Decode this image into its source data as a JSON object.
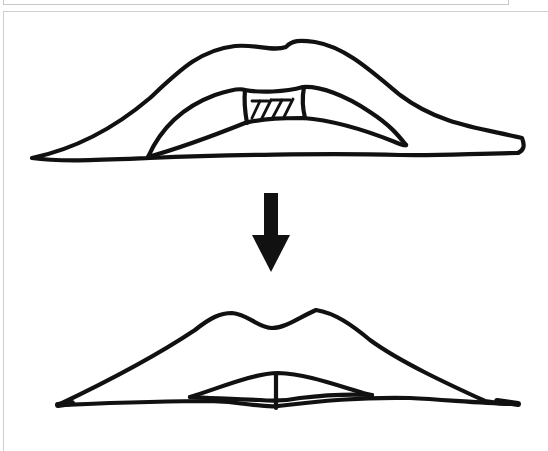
{
  "figure": {
    "panels": [
      {
        "id": "before",
        "label": "Upper lip with central hatched excision wedge"
      },
      {
        "id": "after",
        "label": "Closed lips after reduction with central vertical suture line"
      }
    ],
    "transition_icon": "down-arrow-icon",
    "colors": {
      "ink": "#111111",
      "background": "#ffffff",
      "frame": "#cfcfcf"
    }
  }
}
